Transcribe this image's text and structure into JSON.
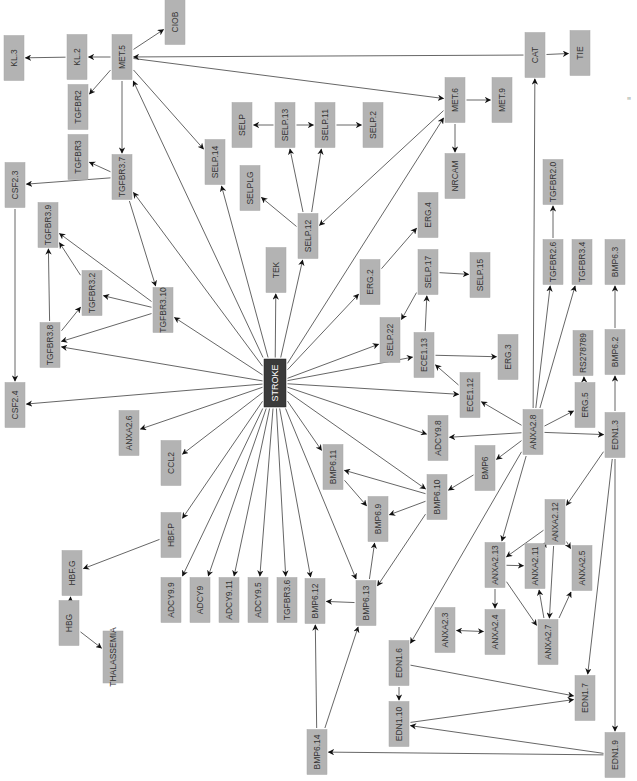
{
  "diagram": {
    "title": "",
    "colors": {
      "node_fill": "#b3b3b3",
      "hub_fill": "#3a3a3a",
      "hub_text": "#ffffff",
      "edge": "#555555",
      "background": "#ffffff"
    },
    "orientation": "rotated-90-ccw",
    "hub": "STROKE",
    "nodes": [
      {
        "id": "STROKE",
        "x": 275,
        "y": 383,
        "w": 22,
        "h": 48,
        "hub": true
      },
      {
        "id": "MET.5",
        "x": 122,
        "y": 57,
        "w": 20,
        "h": 45
      },
      {
        "id": "KL.2",
        "x": 77,
        "y": 57,
        "w": 20,
        "h": 45
      },
      {
        "id": "KL.3",
        "x": 14,
        "y": 58,
        "w": 20,
        "h": 45
      },
      {
        "id": "CIOB",
        "x": 175,
        "y": 22,
        "w": 20,
        "h": 45
      },
      {
        "id": "TGFBR2",
        "x": 78,
        "y": 107,
        "w": 20,
        "h": 45
      },
      {
        "id": "TGFBR3",
        "x": 78,
        "y": 157,
        "w": 20,
        "h": 45
      },
      {
        "id": "TGFBR3.7",
        "x": 122,
        "y": 177,
        "w": 20,
        "h": 45
      },
      {
        "id": "CSF2.3",
        "x": 15,
        "y": 185,
        "w": 20,
        "h": 45
      },
      {
        "id": "SELP.14",
        "x": 215,
        "y": 162,
        "w": 20,
        "h": 45
      },
      {
        "id": "SELP",
        "x": 242,
        "y": 125,
        "w": 20,
        "h": 45
      },
      {
        "id": "SELP.13",
        "x": 285,
        "y": 125,
        "w": 20,
        "h": 45
      },
      {
        "id": "SELP.11",
        "x": 325,
        "y": 125,
        "w": 20,
        "h": 45
      },
      {
        "id": "SELP.2",
        "x": 373,
        "y": 125,
        "w": 20,
        "h": 45
      },
      {
        "id": "SELPLG",
        "x": 250,
        "y": 188,
        "w": 20,
        "h": 45
      },
      {
        "id": "SELP.12",
        "x": 308,
        "y": 236,
        "w": 20,
        "h": 45
      },
      {
        "id": "TEK",
        "x": 276,
        "y": 270,
        "w": 20,
        "h": 45
      },
      {
        "id": "MET.6",
        "x": 455,
        "y": 100,
        "w": 20,
        "h": 45
      },
      {
        "id": "MET.9",
        "x": 502,
        "y": 100,
        "w": 20,
        "h": 45
      },
      {
        "id": "NRCAM",
        "x": 455,
        "y": 176,
        "w": 20,
        "h": 45
      },
      {
        "id": "CAT",
        "x": 535,
        "y": 55,
        "w": 20,
        "h": 45
      },
      {
        "id": "TIE",
        "x": 580,
        "y": 53,
        "w": 20,
        "h": 45
      },
      {
        "id": "TGFBR3.9",
        "x": 48,
        "y": 225,
        "w": 20,
        "h": 45
      },
      {
        "id": "TGFBR3.2",
        "x": 92,
        "y": 293,
        "w": 20,
        "h": 45
      },
      {
        "id": "TGFBR3.10",
        "x": 163,
        "y": 310,
        "w": 20,
        "h": 45
      },
      {
        "id": "TGFBR3.8",
        "x": 50,
        "y": 345,
        "w": 20,
        "h": 45
      },
      {
        "id": "CSF2.4",
        "x": 15,
        "y": 405,
        "w": 20,
        "h": 45
      },
      {
        "id": "ERG.2",
        "x": 370,
        "y": 282,
        "w": 20,
        "h": 45
      },
      {
        "id": "ERG.4",
        "x": 428,
        "y": 215,
        "w": 20,
        "h": 45
      },
      {
        "id": "SELP.17",
        "x": 428,
        "y": 272,
        "w": 20,
        "h": 45
      },
      {
        "id": "SELP.15",
        "x": 480,
        "y": 275,
        "w": 20,
        "h": 45
      },
      {
        "id": "SELP.22",
        "x": 390,
        "y": 340,
        "w": 20,
        "h": 45
      },
      {
        "id": "ECE1.13",
        "x": 424,
        "y": 355,
        "w": 20,
        "h": 45
      },
      {
        "id": "ERG.3",
        "x": 508,
        "y": 357,
        "w": 20,
        "h": 45
      },
      {
        "id": "ECE1.12",
        "x": 470,
        "y": 395,
        "w": 20,
        "h": 45
      },
      {
        "id": "TGFBR2.0",
        "x": 553,
        "y": 182,
        "w": 20,
        "h": 45
      },
      {
        "id": "TGFBR2.6",
        "x": 553,
        "y": 262,
        "w": 20,
        "h": 45
      },
      {
        "id": "TGFBR3.4",
        "x": 582,
        "y": 262,
        "w": 20,
        "h": 45
      },
      {
        "id": "BMP6.3",
        "x": 615,
        "y": 262,
        "w": 20,
        "h": 45
      },
      {
        "id": "RS278789",
        "x": 583,
        "y": 353,
        "w": 20,
        "h": 45
      },
      {
        "id": "BMP6.2",
        "x": 615,
        "y": 352,
        "w": 20,
        "h": 45
      },
      {
        "id": "ERG.5",
        "x": 585,
        "y": 405,
        "w": 20,
        "h": 45
      },
      {
        "id": "EDN1.3",
        "x": 615,
        "y": 435,
        "w": 20,
        "h": 45
      },
      {
        "id": "ANXA2.8",
        "x": 533,
        "y": 432,
        "w": 20,
        "h": 45
      },
      {
        "id": "ADCY9.8",
        "x": 438,
        "y": 438,
        "w": 20,
        "h": 45
      },
      {
        "id": "BMP6",
        "x": 485,
        "y": 468,
        "w": 20,
        "h": 45
      },
      {
        "id": "BMP6.10",
        "x": 437,
        "y": 497,
        "w": 20,
        "h": 45
      },
      {
        "id": "ANXA2.6",
        "x": 129,
        "y": 433,
        "w": 20,
        "h": 45
      },
      {
        "id": "CCL2",
        "x": 171,
        "y": 463,
        "w": 20,
        "h": 45
      },
      {
        "id": "HBF.P",
        "x": 171,
        "y": 535,
        "w": 20,
        "h": 45
      },
      {
        "id": "BMP6.11",
        "x": 333,
        "y": 467,
        "w": 20,
        "h": 45
      },
      {
        "id": "BMP6.9",
        "x": 378,
        "y": 519,
        "w": 20,
        "h": 45
      },
      {
        "id": "ANXA2.12",
        "x": 555,
        "y": 522,
        "w": 20,
        "h": 45
      },
      {
        "id": "ANXA2.13",
        "x": 495,
        "y": 565,
        "w": 20,
        "h": 45
      },
      {
        "id": "ANXA2.11",
        "x": 535,
        "y": 566,
        "w": 20,
        "h": 45
      },
      {
        "id": "ANXA2.5",
        "x": 582,
        "y": 568,
        "w": 20,
        "h": 45
      },
      {
        "id": "ANXA2.4",
        "x": 495,
        "y": 632,
        "w": 20,
        "h": 45
      },
      {
        "id": "ANXA2.3",
        "x": 445,
        "y": 630,
        "w": 20,
        "h": 45
      },
      {
        "id": "ANXA2.7",
        "x": 548,
        "y": 642,
        "w": 20,
        "h": 45
      },
      {
        "id": "HBG",
        "x": 69,
        "y": 623,
        "w": 20,
        "h": 45
      },
      {
        "id": "HBF.G",
        "x": 72,
        "y": 573,
        "w": 20,
        "h": 45
      },
      {
        "id": "THALASSEMIA",
        "x": 113,
        "y": 657,
        "w": 20,
        "h": 52
      },
      {
        "id": "ADCY9.9",
        "x": 171,
        "y": 600,
        "w": 20,
        "h": 45
      },
      {
        "id": "ADCY9",
        "x": 200,
        "y": 600,
        "w": 20,
        "h": 45
      },
      {
        "id": "ADCY9.11",
        "x": 229,
        "y": 600,
        "w": 20,
        "h": 45
      },
      {
        "id": "ADCY9.5",
        "x": 258,
        "y": 600,
        "w": 20,
        "h": 45
      },
      {
        "id": "TGFBR3.6",
        "x": 287,
        "y": 600,
        "w": 20,
        "h": 45
      },
      {
        "id": "BMP6.12",
        "x": 315,
        "y": 601,
        "w": 20,
        "h": 45
      },
      {
        "id": "BMP6.13",
        "x": 366,
        "y": 603,
        "w": 20,
        "h": 45
      },
      {
        "id": "EDN1.6",
        "x": 399,
        "y": 663,
        "w": 20,
        "h": 45
      },
      {
        "id": "EDN1.10",
        "x": 399,
        "y": 724,
        "w": 20,
        "h": 45
      },
      {
        "id": "EDN1.7",
        "x": 585,
        "y": 698,
        "w": 20,
        "h": 45
      },
      {
        "id": "EDN1.9",
        "x": 615,
        "y": 755,
        "w": 20,
        "h": 45
      },
      {
        "id": "BMP6.14",
        "x": 317,
        "y": 752,
        "w": 20,
        "h": 45
      }
    ],
    "edges": [
      {
        "from": "MET.5",
        "to": "KL.2"
      },
      {
        "from": "KL.2",
        "to": "KL.3"
      },
      {
        "from": "MET.5",
        "to": "CIOB"
      },
      {
        "from": "MET.5",
        "to": "TGFBR2"
      },
      {
        "from": "MET.5",
        "to": "TGFBR3.7"
      },
      {
        "from": "MET.5",
        "to": "SELP.14"
      },
      {
        "from": "MET.5",
        "to": "MET.6"
      },
      {
        "from": "CAT",
        "to": "MET.5"
      },
      {
        "from": "STROKE",
        "to": "MET.5"
      },
      {
        "from": "TGFBR3.7",
        "to": "TGFBR3"
      },
      {
        "from": "TGFBR3.7",
        "to": "CSF2.3"
      },
      {
        "from": "TGFBR3.7",
        "to": "TGFBR3.10"
      },
      {
        "from": "STROKE",
        "to": "TGFBR3.7"
      },
      {
        "from": "CSF2.3",
        "to": "CSF2.4"
      },
      {
        "from": "SELP.13",
        "to": "SELP"
      },
      {
        "from": "SELP.13",
        "to": "SELP.11"
      },
      {
        "from": "SELP.11",
        "to": "SELP.2"
      },
      {
        "from": "SELP.12",
        "to": "SELP.13"
      },
      {
        "from": "SELP.12",
        "to": "SELP.11"
      },
      {
        "from": "SELP.12",
        "to": "SELPLG"
      },
      {
        "from": "MET.6",
        "to": "SELP.12"
      },
      {
        "from": "STROKE",
        "to": "SELP.12"
      },
      {
        "from": "STROKE",
        "to": "SELP.14"
      },
      {
        "from": "STROKE",
        "to": "TEK"
      },
      {
        "from": "STROKE",
        "to": "MET.6"
      },
      {
        "from": "MET.6",
        "to": "MET.9"
      },
      {
        "from": "MET.6",
        "to": "NRCAM"
      },
      {
        "from": "CAT",
        "to": "TIE"
      },
      {
        "from": "ANXA2.8",
        "to": "CAT"
      },
      {
        "from": "TGFBR3.10",
        "to": "TGFBR3.9"
      },
      {
        "from": "TGFBR3.10",
        "to": "TGFBR3.2"
      },
      {
        "from": "TGFBR3.10",
        "to": "TGFBR3.8"
      },
      {
        "from": "TGFBR3.2",
        "to": "TGFBR3.9"
      },
      {
        "from": "TGFBR3.8",
        "to": "TGFBR3.9"
      },
      {
        "from": "TGFBR3.8",
        "to": "TGFBR3.2"
      },
      {
        "from": "STROKE",
        "to": "TGFBR3.10"
      },
      {
        "from": "STROKE",
        "to": "TGFBR3.8"
      },
      {
        "from": "STROKE",
        "to": "CSF2.4"
      },
      {
        "from": "STROKE",
        "to": "ERG.2"
      },
      {
        "from": "ERG.2",
        "to": "ERG.4"
      },
      {
        "from": "STROKE",
        "to": "SELP.22"
      },
      {
        "from": "SELP.17",
        "to": "SELP.22"
      },
      {
        "from": "SELP.17",
        "to": "SELP.15"
      },
      {
        "from": "ECE1.13",
        "to": "SELP.17"
      },
      {
        "from": "ECE1.13",
        "to": "ERG.3"
      },
      {
        "from": "STROKE",
        "to": "ECE1.13"
      },
      {
        "from": "ECE1.12",
        "to": "ECE1.13"
      },
      {
        "from": "STROKE",
        "to": "ECE1.12"
      },
      {
        "from": "ANXA2.8",
        "to": "ECE1.12"
      },
      {
        "from": "TGFBR2.6",
        "to": "TGFBR2.0"
      },
      {
        "from": "ANXA2.8",
        "to": "TGFBR2.6"
      },
      {
        "from": "ANXA2.8",
        "to": "TGFBR3.4"
      },
      {
        "from": "ERG.5",
        "to": "RS278789"
      },
      {
        "from": "ANXA2.8",
        "to": "ERG.5"
      },
      {
        "from": "BMP6.2",
        "to": "BMP6.3"
      },
      {
        "from": "EDN1.3",
        "to": "BMP6.2"
      },
      {
        "from": "ANXA2.8",
        "to": "EDN1.3"
      },
      {
        "from": "ANXA2.8",
        "to": "ADCY9.8"
      },
      {
        "from": "STROKE",
        "to": "ADCY9.8"
      },
      {
        "from": "ANXA2.8",
        "to": "BMP6"
      },
      {
        "from": "BMP6",
        "to": "BMP6.10"
      },
      {
        "from": "STROKE",
        "to": "BMP6.10"
      },
      {
        "from": "BMP6.10",
        "to": "BMP6.11"
      },
      {
        "from": "BMP6.10",
        "to": "BMP6.9"
      },
      {
        "from": "BMP6.10",
        "to": "BMP6.13"
      },
      {
        "from": "BMP6.11",
        "to": "BMP6.9"
      },
      {
        "from": "STROKE",
        "to": "BMP6.11"
      },
      {
        "from": "BMP6.13",
        "to": "BMP6.9"
      },
      {
        "from": "BMP6.13",
        "to": "BMP6.12"
      },
      {
        "from": "STROKE",
        "to": "BMP6.13"
      },
      {
        "from": "STROKE",
        "to": "BMP6.12"
      },
      {
        "from": "STROKE",
        "to": "TGFBR3.6"
      },
      {
        "from": "STROKE",
        "to": "ADCY9.5"
      },
      {
        "from": "STROKE",
        "to": "ADCY9.11"
      },
      {
        "from": "STROKE",
        "to": "ADCY9"
      },
      {
        "from": "STROKE",
        "to": "ADCY9.9"
      },
      {
        "from": "STROKE",
        "to": "HBF.P"
      },
      {
        "from": "STROKE",
        "to": "CCL2"
      },
      {
        "from": "STROKE",
        "to": "ANXA2.6"
      },
      {
        "from": "HBF.P",
        "to": "HBF.G"
      },
      {
        "from": "HBG",
        "to": "HBF.G"
      },
      {
        "from": "HBG",
        "to": "THALASSEMIA"
      },
      {
        "from": "EDN1.3",
        "to": "ANXA2.12"
      },
      {
        "from": "ANXA2.8",
        "to": "ANXA2.13"
      },
      {
        "from": "ANXA2.8",
        "to": "EDN1.6"
      },
      {
        "from": "ANXA2.12",
        "to": "ANXA2.13"
      },
      {
        "from": "ANXA2.12",
        "to": "ANXA2.11"
      },
      {
        "from": "ANXA2.12",
        "to": "ANXA2.5"
      },
      {
        "from": "ANXA2.12",
        "to": "ANXA2.7"
      },
      {
        "from": "ANXA2.13",
        "to": "ANXA2.11"
      },
      {
        "from": "ANXA2.13",
        "to": "ANXA2.4"
      },
      {
        "from": "ANXA2.13",
        "to": "ANXA2.7"
      },
      {
        "from": "ANXA2.7",
        "to": "ANXA2.11"
      },
      {
        "from": "ANXA2.7",
        "to": "ANXA2.5"
      },
      {
        "from": "ANXA2.4",
        "to": "ANXA2.3",
        "bidirectional": true
      },
      {
        "from": "EDN1.3",
        "to": "EDN1.7"
      },
      {
        "from": "EDN1.3",
        "to": "EDN1.9"
      },
      {
        "from": "EDN1.6",
        "to": "EDN1.10"
      },
      {
        "from": "EDN1.6",
        "to": "EDN1.7"
      },
      {
        "from": "EDN1.10",
        "to": "EDN1.7"
      },
      {
        "from": "EDN1.9",
        "to": "EDN1.10"
      },
      {
        "from": "EDN1.9",
        "to": "BMP6.14"
      },
      {
        "from": "BMP6.14",
        "to": "BMP6.12"
      },
      {
        "from": "BMP6.14",
        "to": "BMP6.13"
      }
    ]
  }
}
